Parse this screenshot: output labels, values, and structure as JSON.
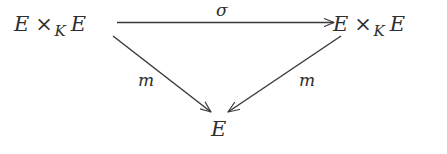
{
  "diagram": {
    "type": "commutative-triangle",
    "background_color": "#ffffff",
    "stroke_color": "#3a3a3a",
    "text_color": "#2e2e2e",
    "nodes": [
      {
        "id": "source",
        "name": "fiber-product-source",
        "text": "E ×K E",
        "base": "E",
        "operator": "×",
        "subscript": "K",
        "second": "E",
        "position": "top-left"
      },
      {
        "id": "target",
        "name": "fiber-product-target",
        "text": "E ×K E",
        "base": "E",
        "operator": "×",
        "subscript": "K",
        "second": "E",
        "position": "top-right"
      },
      {
        "id": "bottom",
        "name": "curve-object",
        "text": "E",
        "position": "bottom-center"
      }
    ],
    "edges": [
      {
        "id": "sigma",
        "name": "swap-morphism",
        "label": "σ",
        "from": "source",
        "to": "target",
        "direction": "horizontal-right",
        "label_position": "above"
      },
      {
        "id": "m-left",
        "name": "multiplication-left",
        "label": "m",
        "from": "source",
        "to": "bottom",
        "direction": "diagonal-down-right",
        "label_position": "left"
      },
      {
        "id": "m-right",
        "name": "multiplication-right",
        "label": "m",
        "from": "target",
        "to": "bottom",
        "direction": "diagonal-down-left",
        "label_position": "right"
      }
    ]
  }
}
